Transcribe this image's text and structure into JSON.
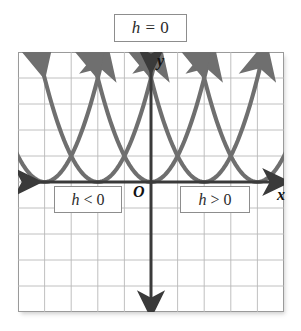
{
  "figure": {
    "type": "coordinate-grid-diagram",
    "title_label": "h = 0",
    "title_lhs": "h",
    "title_op": "=",
    "title_rhs": "0",
    "axis_labels": {
      "x": "x",
      "y": "y",
      "origin": "O"
    },
    "region_labels": [
      {
        "id": "h-negative",
        "text": "h < 0",
        "lhs": "h",
        "op": "<",
        "rhs": "0"
      },
      {
        "id": "h-positive",
        "text": "h > 0",
        "lhs": "h",
        "op": ">",
        "rhs": "0"
      }
    ],
    "colors": {
      "curve": "#6f6f6f",
      "axis": "#3a3a3a",
      "grid": "#b5b5b5",
      "grid_border": "#9a9a9a",
      "box_border": "#8d8d8d",
      "text": "#2b2b2b",
      "background": "#ffffff"
    }
  },
  "chart_data": {
    "type": "line",
    "xlabel": "x",
    "ylabel": "y",
    "xlim": [
      -5,
      5
    ],
    "ylim": [
      -5,
      5
    ],
    "grid": true,
    "grid_step": 1,
    "legend": "none",
    "annotations": [
      {
        "text": "h = 0",
        "position": "above-plot-center"
      },
      {
        "text": "h < 0",
        "position": "below-axis-left",
        "x": -3,
        "y": -0.8
      },
      {
        "text": "h > 0",
        "position": "below-axis-right",
        "x": 1.8,
        "y": -0.8
      },
      {
        "text": "O",
        "position": "origin",
        "x": -0.5,
        "y": -0.5
      }
    ],
    "series": [
      {
        "name": "y = (x + 4)^2",
        "vertex": [
          -4,
          0
        ],
        "a": 1,
        "h": -4,
        "k": 0,
        "arrow_ends": true
      },
      {
        "name": "y = (x + 2)^2",
        "vertex": [
          -2,
          0
        ],
        "a": 1,
        "h": -2,
        "k": 0,
        "arrow_ends": true
      },
      {
        "name": "y = x^2",
        "vertex": [
          0,
          0
        ],
        "a": 1,
        "h": 0,
        "k": 0,
        "arrow_ends": true
      },
      {
        "name": "y = (x - 2)^2",
        "vertex": [
          2,
          0
        ],
        "a": 1,
        "h": 2,
        "k": 0,
        "arrow_ends": true
      },
      {
        "name": "y = (x - 4)^2",
        "vertex": [
          4,
          0
        ],
        "a": 1,
        "h": 4,
        "k": 0,
        "arrow_ends": true
      }
    ],
    "xticks": [
      -5,
      -4,
      -3,
      -2,
      -1,
      0,
      1,
      2,
      3,
      4,
      5
    ],
    "yticks": [
      -5,
      -4,
      -3,
      -2,
      -1,
      0,
      1,
      2,
      3,
      4,
      5
    ]
  }
}
